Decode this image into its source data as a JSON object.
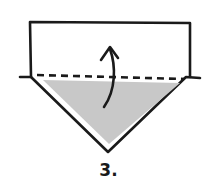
{
  "diagram": {
    "type": "origami-fold-instruction",
    "step_label": "3.",
    "colors": {
      "stroke": "#1a1a1a",
      "shaded_fill": "#c8c8c8",
      "paper_fill": "#ffffff",
      "background": "#ffffff"
    },
    "elements": {
      "rectangle_flap": "open rectangle flap above fold line",
      "fold_line": "dashed valley fold line",
      "shaded_triangle": "gray triangle (colored side of paper)",
      "outer_triangle": "outlined triangle below fold",
      "fold_arrow": "curved arrow pointing up (fold upward)"
    }
  }
}
